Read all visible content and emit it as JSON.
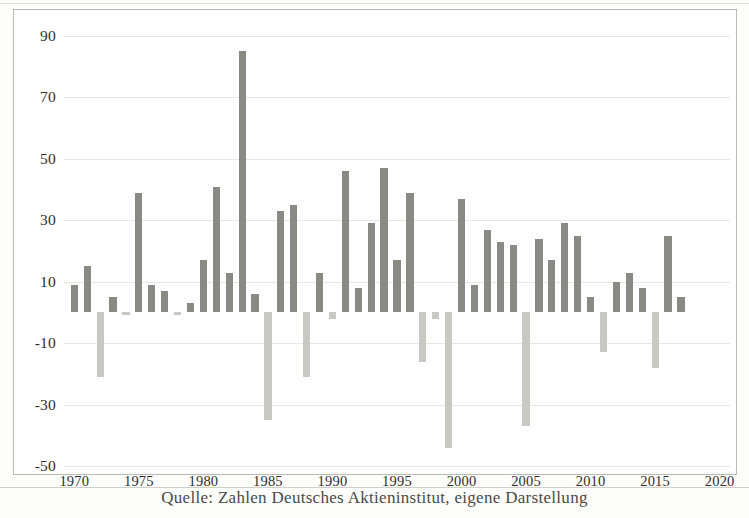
{
  "caption": "Quelle: Zahlen Deutsches Aktieninstitut, eigene Darstellung",
  "colors": {
    "positive_bar": "#8a8a85",
    "negative_bar": "#c9c9c4",
    "gridline": "#e6e6e2",
    "frame": "#b9b9b6",
    "text": "#2e2e2e",
    "background": "#fefefe"
  },
  "chart_data": {
    "type": "bar",
    "title": "",
    "subtitle": "",
    "xlabel": "",
    "ylabel": "",
    "xlim": [
      1969.2,
      2020.8
    ],
    "ylim": [
      -50,
      90
    ],
    "yticks": [
      90,
      70,
      50,
      30,
      10,
      -10,
      -30,
      -50
    ],
    "ytick_labels": [
      "90",
      "70",
      "50",
      "30",
      "10",
      "-10",
      "-30",
      "-50"
    ],
    "xticks": [
      1970,
      1975,
      1980,
      1985,
      1990,
      1995,
      2000,
      2005,
      2010,
      2015,
      2020
    ],
    "xtick_labels": [
      "1970",
      "1975",
      "1980",
      "1985",
      "1990",
      "1995",
      "2000",
      "2005",
      "2010",
      "2015",
      "2020"
    ],
    "grid": true,
    "grid_axis": "y",
    "legend": false,
    "legend_position": "none",
    "zero_line": 0,
    "categories": [
      "1970",
      "1971",
      "1972",
      "1973",
      "1974",
      "1975",
      "1976",
      "1977",
      "1978",
      "1979",
      "1980",
      "1981",
      "1982",
      "1983",
      "1984",
      "1985",
      "1986",
      "1987",
      "1988",
      "1989",
      "1990",
      "1991",
      "1992",
      "1993",
      "1994",
      "1995",
      "1996",
      "1997",
      "1998",
      "1999",
      "2000",
      "2001",
      "2002",
      "2003",
      "2004",
      "2005",
      "2006",
      "2007",
      "2008",
      "2009",
      "2010",
      "2011",
      "2012",
      "2013",
      "2014",
      "2015",
      "2016",
      "2017",
      "2018",
      "2019",
      "2020"
    ],
    "values": [
      9,
      15,
      -21,
      5,
      -1,
      39,
      9,
      7,
      -1,
      3,
      17,
      41,
      13,
      85,
      6,
      -35,
      33,
      35,
      -21,
      13,
      -2,
      46,
      8,
      29,
      47,
      17,
      39,
      -16,
      -2,
      -44,
      37,
      9,
      27,
      23,
      22,
      -37,
      24,
      17,
      29,
      25,
      5,
      -13,
      10,
      13,
      8,
      -18,
      25,
      5,
      0,
      0,
      0
    ],
    "series": [
      {
        "name": "Jährliche Rendite (%)",
        "values": [
          9,
          15,
          -21,
          5,
          -1,
          39,
          9,
          7,
          -1,
          3,
          17,
          41,
          13,
          85,
          6,
          -35,
          33,
          35,
          -21,
          13,
          -2,
          46,
          8,
          29,
          47,
          17,
          39,
          -16,
          -2,
          -44,
          37,
          9,
          27,
          23,
          22,
          -37,
          24,
          17,
          29,
          25,
          5,
          -13,
          10,
          13,
          8,
          -18,
          25,
          5,
          0,
          0,
          0
        ]
      }
    ]
  }
}
